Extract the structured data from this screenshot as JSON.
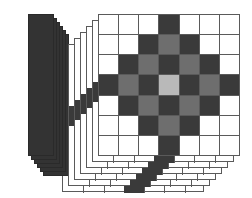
{
  "palette": {
    "white": "#ffffff",
    "dark": "#3a3a3a",
    "medium": "#6e6e6e",
    "light": "#b9b9b9",
    "gridline": "#5a5a5a",
    "panel": "#333333",
    "background": "#ffffff"
  },
  "dark_panel_stack": {
    "name": "dark-panel-stack",
    "count": 6,
    "sheet_width": 26,
    "sheet_height": 142,
    "offset_x": 3,
    "offset_y": 4,
    "origin_x": 28,
    "origin_y": 14,
    "color": "#333333"
  },
  "grid_stack": {
    "name": "grid-sheet-stack",
    "layers": 6,
    "offset_x": 6,
    "offset_y": 6,
    "sheet_size": 142,
    "front_origin_x": 38,
    "front_origin_y": 14
  },
  "chart_data": {
    "type": "heatmap",
    "xlabel": "",
    "ylabel": "",
    "rows": 7,
    "cols": 7,
    "legend": [
      {
        "label": "empty",
        "color": "#ffffff",
        "value": 0
      },
      {
        "label": "dark",
        "color": "#3a3a3a",
        "value": 3
      },
      {
        "label": "medium",
        "color": "#6e6e6e",
        "value": 2
      },
      {
        "label": "light",
        "color": "#b9b9b9",
        "value": 1
      }
    ],
    "values": [
      [
        0,
        0,
        0,
        3,
        0,
        0,
        0
      ],
      [
        0,
        0,
        3,
        2,
        3,
        0,
        0
      ],
      [
        0,
        3,
        2,
        3,
        2,
        3,
        0
      ],
      [
        3,
        2,
        3,
        1,
        3,
        2,
        3
      ],
      [
        0,
        3,
        2,
        3,
        2,
        3,
        0
      ],
      [
        0,
        0,
        3,
        2,
        3,
        0,
        0
      ],
      [
        0,
        0,
        0,
        3,
        0,
        0,
        0
      ]
    ],
    "cell_classes": [
      [
        "c-white",
        "c-white",
        "c-white",
        "c-dark",
        "c-white",
        "c-white",
        "c-white"
      ],
      [
        "c-white",
        "c-white",
        "c-dark",
        "c-med",
        "c-dark",
        "c-white",
        "c-white"
      ],
      [
        "c-white",
        "c-dark",
        "c-med",
        "c-dark",
        "c-med",
        "c-dark",
        "c-white"
      ],
      [
        "c-dark",
        "c-med",
        "c-dark",
        "c-light",
        "c-dark",
        "c-med",
        "c-dark"
      ],
      [
        "c-white",
        "c-dark",
        "c-med",
        "c-dark",
        "c-med",
        "c-dark",
        "c-white"
      ],
      [
        "c-white",
        "c-white",
        "c-dark",
        "c-med",
        "c-dark",
        "c-white",
        "c-white"
      ],
      [
        "c-white",
        "c-white",
        "c-white",
        "c-dark",
        "c-white",
        "c-white",
        "c-white"
      ]
    ]
  }
}
